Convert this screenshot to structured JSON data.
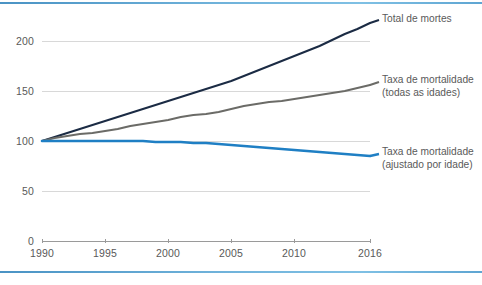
{
  "chart_data": {
    "type": "line",
    "title": "",
    "subtitle": "",
    "xlabel": "",
    "ylabel": "",
    "xlim": [
      1990,
      2016
    ],
    "ylim": [
      0,
      220
    ],
    "grid": true,
    "legend_position": "right",
    "y_ticks": [
      0,
      50,
      100,
      150,
      200
    ],
    "y_tick_labels": [
      "0",
      "50",
      "100",
      "150",
      "200"
    ],
    "x_ticks": [
      1990,
      1995,
      2000,
      2005,
      2010,
      2016
    ],
    "x_tick_labels": [
      "1990",
      "1995",
      "2000",
      "2005",
      "2010",
      "2016"
    ],
    "x": [
      1990,
      1991,
      1992,
      1993,
      1994,
      1995,
      1996,
      1997,
      1998,
      1999,
      2000,
      2001,
      2002,
      2003,
      2004,
      2005,
      2006,
      2007,
      2008,
      2009,
      2010,
      2011,
      2012,
      2013,
      2014,
      2015,
      2016
    ],
    "series": [
      {
        "name": "Total de mortes",
        "color": "#1b2b44",
        "values": [
          100,
          104,
          108,
          112,
          116,
          120,
          124,
          128,
          132,
          136,
          140,
          144,
          148,
          152,
          156,
          160,
          165,
          170,
          175,
          180,
          185,
          190,
          195,
          201,
          207,
          212,
          218
        ]
      },
      {
        "name": "Taxa de mortalidade (todas as idades)",
        "color": "#6b6b67",
        "values": [
          100,
          103,
          105,
          107,
          108,
          110,
          112,
          115,
          117,
          119,
          121,
          124,
          126,
          127,
          129,
          132,
          135,
          137,
          139,
          140,
          142,
          144,
          146,
          148,
          150,
          153,
          156
        ]
      },
      {
        "name": "Taxa de mortalidade (ajustado por idade)",
        "color": "#1f7fc4",
        "values": [
          100,
          100,
          100,
          100,
          100,
          100,
          100,
          100,
          100,
          99,
          99,
          99,
          98,
          98,
          97,
          96,
          95,
          94,
          93,
          92,
          91,
          90,
          89,
          88,
          87,
          86,
          85
        ]
      }
    ],
    "legend_entries": [
      {
        "label_line1": "Total de mortes",
        "label_line2": "",
        "color": "#1b2b44"
      },
      {
        "label_line1": "Taxa de mortalidade",
        "label_line2": "(todas as idades)",
        "color": "#6b6b67"
      },
      {
        "label_line1": "Taxa de mortalidade",
        "label_line2": "(ajustado por idade)",
        "color": "#1f7fc4"
      }
    ]
  },
  "colors": {
    "border_accent": "#5ea5d2",
    "gridline": "#d8d8d8",
    "axis": "#9a9a9a",
    "tick_text": "#595959",
    "legend_text": "#5a5a5a",
    "background": "#ffffff"
  }
}
